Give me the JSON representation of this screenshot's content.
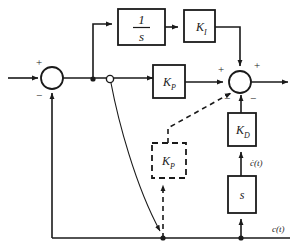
{
  "figure": {
    "type": "control-system-block-diagram",
    "background_color": "#ffffff",
    "line_color": "#1a1a1a"
  },
  "blocks": {
    "integrator": {
      "label": "1/s",
      "numerator": "1",
      "denominator": "s",
      "style": "solid",
      "x": 118,
      "y": 9,
      "w": 47,
      "h": 36
    },
    "integral_gain": {
      "label": "K",
      "subscript": "I",
      "style": "solid",
      "x": 184,
      "y": 10,
      "w": 31,
      "h": 32
    },
    "proportional_gain": {
      "label": "K",
      "subscript": "P",
      "style": "solid",
      "x": 153,
      "y": 65,
      "w": 32,
      "h": 33
    },
    "proportional_gain_alt": {
      "label": "K",
      "subscript": "P",
      "style": "dashed",
      "x": 152,
      "y": 143,
      "w": 34,
      "h": 35
    },
    "derivative_gain": {
      "label": "K",
      "subscript": "D",
      "style": "solid",
      "x": 228,
      "y": 113,
      "w": 28,
      "h": 33
    },
    "differentiator": {
      "label": "s",
      "style": "solid",
      "x": 228,
      "y": 176,
      "w": 28,
      "h": 37
    }
  },
  "summing_junctions": [
    {
      "name": "input-error-summer",
      "cx": 52,
      "cy": 78,
      "r": 11,
      "signs": [
        {
          "label": "+",
          "position": "top-left",
          "x": 39,
          "y": 66
        },
        {
          "label": "−",
          "position": "bottom-left",
          "x": 39,
          "y": 96
        }
      ]
    },
    {
      "name": "control-signal-summer",
      "cx": 240,
      "cy": 82,
      "r": 11,
      "signs": [
        {
          "label": "+",
          "position": "left",
          "x": 221,
          "y": 70
        },
        {
          "label": "+",
          "position": "top-right",
          "x": 256,
          "y": 66
        },
        {
          "label": "−",
          "position": "bottom-left",
          "x": 226,
          "y": 99
        },
        {
          "label": "−",
          "position": "bottom-right",
          "x": 252,
          "y": 99
        }
      ]
    }
  ],
  "nodes": [
    {
      "name": "integrator-branch-node",
      "type": "filled-dot",
      "cx": 93,
      "cy": 79,
      "r": 2.6
    },
    {
      "name": "error-pickoff-node",
      "type": "open-circle",
      "cx": 110,
      "cy": 79,
      "r": 3.6
    },
    {
      "name": "output-feedback-node-left",
      "type": "filled-dot",
      "cx": 163,
      "cy": 238,
      "r": 2.6
    },
    {
      "name": "output-feedback-node-right",
      "type": "filled-dot",
      "cx": 241,
      "cy": 238,
      "r": 2.6
    }
  ],
  "signal_labels": {
    "output_rate": "ċ(t)",
    "output": "c(t)"
  },
  "signal_label_positions": {
    "output_rate": {
      "x": 250,
      "y": 163
    },
    "output": {
      "x": 272,
      "y": 229
    }
  }
}
